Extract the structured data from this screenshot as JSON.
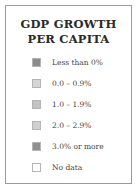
{
  "chart_data": {
    "type": "legend",
    "title": "GDP GROWTH PER CAPITA",
    "title_lines": [
      "GDP GROWTH",
      "PER CAPITA"
    ],
    "entries": [
      {
        "label": "Less than 0%",
        "color": "#8c8c8c"
      },
      {
        "label": "0.0 – 0.9%",
        "color": "#d6d6d6"
      },
      {
        "label": "1.0 – 1.9%",
        "color": "#c4c4c4"
      },
      {
        "label": "2.0 – 2.9%",
        "color": "#d0d0d0"
      },
      {
        "label": "3.0% or more",
        "color": "#8f8f8f"
      },
      {
        "label": "No data",
        "color": "#ffffff"
      }
    ]
  }
}
